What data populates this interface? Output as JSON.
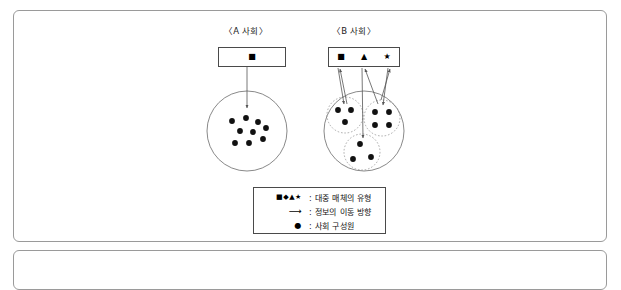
{
  "figure": {
    "groups": [
      {
        "id": "society-a",
        "title": "〈A 사회〉",
        "media_box": {
          "symbols": [
            "■"
          ]
        },
        "society_circle": {
          "members": 9,
          "subgroups": 0
        }
      },
      {
        "id": "society-b",
        "title": "〈B 사회〉",
        "media_box": {
          "symbols": [
            "■",
            "▲",
            "★"
          ]
        },
        "society_circle": {
          "members": 10,
          "subgroups": 3,
          "subgroup_members": [
            3,
            4,
            3
          ]
        }
      }
    ],
    "legend": {
      "rows": [
        {
          "symbol": "■◆▲★",
          "text": ": 대중 매체의 유형"
        },
        {
          "symbol": "⟶",
          "text": ": 정보의 이동 방향"
        },
        {
          "symbol": "●",
          "text": ": 사회 구성원"
        }
      ]
    },
    "colors": {
      "frame": "#9a9a9a",
      "box_border": "#4a4a4a",
      "circle_stroke": "#6b6b6b",
      "subcircle_stroke": "#8a8a8a",
      "member_fill": "#111111",
      "arrow": "#555555",
      "text": "#111111"
    }
  }
}
